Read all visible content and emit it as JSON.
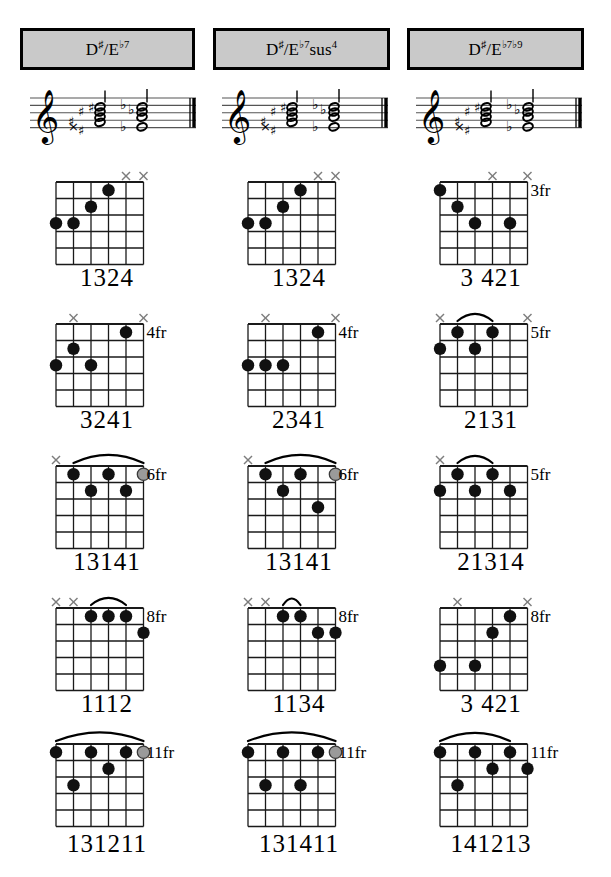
{
  "page": {
    "chord_family": "D#/Eb dominant 7 chords",
    "grid": {
      "columns": 3,
      "rows": 5
    }
  },
  "headers": [
    {
      "id": "header-eb7",
      "root": "D♯/E",
      "quality": "♭7",
      "display": "D♯/E♭7"
    },
    {
      "id": "header-eb7sus4",
      "root": "D♯/E",
      "quality": "♭7sus4",
      "display": "D♯/E♭7sus4"
    },
    {
      "id": "header-eb7b9",
      "root": "D♯/E",
      "quality": "♭7♭9",
      "display": "D♯/E♭7♭9"
    }
  ],
  "notation": [
    {
      "id": "staff-eb7",
      "clef": "treble",
      "accidentals": "sharps-and-flats",
      "barline": "final"
    },
    {
      "id": "staff-eb7sus4",
      "clef": "treble",
      "accidentals": "sharps-and-flats",
      "barline": "final"
    },
    {
      "id": "staff-eb7b9",
      "clef": "treble",
      "accidentals": "sharps-and-flats",
      "barline": "final"
    }
  ],
  "colors": {
    "grid_line": "#1a1a1a",
    "dot_filled": "#111111",
    "dot_optional": "#9a9a9a",
    "mute_mark": "#7d7d7d",
    "header_fill": "#c9c9c9",
    "header_border": "#000000"
  },
  "legend": {
    "filled_dot": "fretted note",
    "gray_dot": "optional note",
    "x_mark": "string not played",
    "arc": "barre"
  },
  "chords": [
    {
      "id": "eb7-pos1",
      "row": 1,
      "col": 1,
      "name": "D♯/E♭7",
      "fingering": "1324",
      "fret_label": "",
      "muted": [
        1,
        2
      ],
      "barre": null,
      "dots": [
        {
          "string": 3,
          "fret": 1,
          "type": "filled"
        },
        {
          "string": 4,
          "fret": 2,
          "type": "filled"
        },
        {
          "string": 5,
          "fret": 3,
          "type": "filled"
        },
        {
          "string": 6,
          "fret": 3,
          "type": "filled"
        }
      ]
    },
    {
      "id": "eb7sus4-pos1",
      "row": 1,
      "col": 2,
      "name": "D♯/E♭7sus4",
      "fingering": "1324",
      "fret_label": "",
      "muted": [
        1,
        2
      ],
      "barre": null,
      "dots": [
        {
          "string": 3,
          "fret": 1,
          "type": "filled"
        },
        {
          "string": 4,
          "fret": 2,
          "type": "filled"
        },
        {
          "string": 5,
          "fret": 3,
          "type": "filled"
        },
        {
          "string": 6,
          "fret": 3,
          "type": "filled"
        }
      ]
    },
    {
      "id": "eb7b9-pos1",
      "row": 1,
      "col": 3,
      "name": "D♯/E♭7♭9",
      "fingering": "3 421",
      "fret_label": "3fr",
      "muted": [
        1,
        3
      ],
      "barre": null,
      "dots": [
        {
          "string": 6,
          "fret": 1,
          "type": "filled"
        },
        {
          "string": 5,
          "fret": 2,
          "type": "filled"
        },
        {
          "string": 2,
          "fret": 3,
          "type": "filled"
        },
        {
          "string": 4,
          "fret": 3,
          "type": "filled"
        }
      ]
    },
    {
      "id": "eb7-pos2",
      "row": 2,
      "col": 1,
      "name": "D♯/E♭7",
      "fingering": "3241",
      "fret_label": "4fr",
      "muted": [
        1,
        5
      ],
      "barre": null,
      "dots": [
        {
          "string": 2,
          "fret": 1,
          "type": "filled"
        },
        {
          "string": 5,
          "fret": 2,
          "type": "filled"
        },
        {
          "string": 6,
          "fret": 3,
          "type": "filled"
        },
        {
          "string": 4,
          "fret": 3,
          "type": "filled"
        }
      ]
    },
    {
      "id": "eb7sus4-pos2",
      "row": 2,
      "col": 2,
      "name": "D♯/E♭7sus4",
      "fingering": "2341",
      "fret_label": "4fr",
      "muted": [
        1,
        5
      ],
      "barre": null,
      "dots": [
        {
          "string": 2,
          "fret": 1,
          "type": "filled"
        },
        {
          "string": 6,
          "fret": 3,
          "type": "filled"
        },
        {
          "string": 5,
          "fret": 3,
          "type": "filled"
        },
        {
          "string": 4,
          "fret": 3,
          "type": "filled"
        }
      ]
    },
    {
      "id": "eb7b9-pos2",
      "row": 2,
      "col": 3,
      "name": "D♯/E♭7♭9",
      "fingering": "2131",
      "fret_label": "5fr",
      "muted": [
        1,
        6
      ],
      "barre": {
        "from_string": 5,
        "to_string": 3,
        "fret": 1
      },
      "dots": [
        {
          "string": 5,
          "fret": 1,
          "type": "filled"
        },
        {
          "string": 3,
          "fret": 1,
          "type": "filled"
        },
        {
          "string": 6,
          "fret": 2,
          "type": "filled"
        },
        {
          "string": 4,
          "fret": 2,
          "type": "filled"
        }
      ]
    },
    {
      "id": "eb7-pos3",
      "row": 3,
      "col": 1,
      "name": "D♯/E♭7",
      "fingering": "13141",
      "fret_label": "6fr",
      "muted": [
        6
      ],
      "barre": {
        "from_string": 5,
        "to_string": 1,
        "fret": 1
      },
      "dots": [
        {
          "string": 5,
          "fret": 1,
          "type": "filled"
        },
        {
          "string": 3,
          "fret": 1,
          "type": "filled"
        },
        {
          "string": 1,
          "fret": 1,
          "type": "optional"
        },
        {
          "string": 4,
          "fret": 2,
          "type": "filled"
        },
        {
          "string": 2,
          "fret": 2,
          "type": "filled"
        }
      ]
    },
    {
      "id": "eb7sus4-pos3",
      "row": 3,
      "col": 2,
      "name": "D♯/E♭7sus4",
      "fingering": "13141",
      "fret_label": "6fr",
      "muted": [
        6
      ],
      "barre": {
        "from_string": 5,
        "to_string": 1,
        "fret": 1
      },
      "dots": [
        {
          "string": 5,
          "fret": 1,
          "type": "filled"
        },
        {
          "string": 3,
          "fret": 1,
          "type": "filled"
        },
        {
          "string": 1,
          "fret": 1,
          "type": "optional"
        },
        {
          "string": 4,
          "fret": 2,
          "type": "filled"
        },
        {
          "string": 2,
          "fret": 3,
          "type": "filled"
        }
      ]
    },
    {
      "id": "eb7b9-pos3",
      "row": 3,
      "col": 3,
      "name": "D♯/E♭7♭9",
      "fingering": "21314",
      "fret_label": "5fr",
      "muted": [
        6
      ],
      "barre": {
        "from_string": 5,
        "to_string": 3,
        "fret": 1
      },
      "dots": [
        {
          "string": 5,
          "fret": 1,
          "type": "filled"
        },
        {
          "string": 3,
          "fret": 1,
          "type": "filled"
        },
        {
          "string": 6,
          "fret": 2,
          "type": "filled"
        },
        {
          "string": 4,
          "fret": 2,
          "type": "filled"
        },
        {
          "string": 2,
          "fret": 2,
          "type": "filled"
        }
      ]
    },
    {
      "id": "eb7-pos4",
      "row": 4,
      "col": 1,
      "name": "D♯/E♭7",
      "fingering": "1112",
      "fret_label": "8fr",
      "muted": [
        6,
        5
      ],
      "barre": {
        "from_string": 4,
        "to_string": 2,
        "fret": 1
      },
      "dots": [
        {
          "string": 4,
          "fret": 1,
          "type": "filled"
        },
        {
          "string": 3,
          "fret": 1,
          "type": "filled"
        },
        {
          "string": 2,
          "fret": 1,
          "type": "filled"
        },
        {
          "string": 1,
          "fret": 2,
          "type": "filled"
        }
      ]
    },
    {
      "id": "eb7sus4-pos4",
      "row": 4,
      "col": 2,
      "name": "D♯/E♭7sus4",
      "fingering": "1134",
      "fret_label": "8fr",
      "muted": [
        6,
        5
      ],
      "barre": {
        "from_string": 4,
        "to_string": 3,
        "fret": 1
      },
      "dots": [
        {
          "string": 4,
          "fret": 1,
          "type": "filled"
        },
        {
          "string": 3,
          "fret": 1,
          "type": "filled"
        },
        {
          "string": 2,
          "fret": 2,
          "type": "filled"
        },
        {
          "string": 1,
          "fret": 2,
          "type": "filled"
        }
      ]
    },
    {
      "id": "eb7b9-pos4",
      "row": 4,
      "col": 3,
      "name": "D♯/E♭7♭9",
      "fingering": "3 421",
      "fret_label": "8fr",
      "muted": [
        5,
        1
      ],
      "barre": null,
      "dots": [
        {
          "string": 2,
          "fret": 1,
          "type": "filled"
        },
        {
          "string": 3,
          "fret": 2,
          "type": "filled"
        },
        {
          "string": 6,
          "fret": 4,
          "type": "filled"
        },
        {
          "string": 4,
          "fret": 4,
          "type": "filled"
        }
      ]
    },
    {
      "id": "eb7-pos5",
      "row": 5,
      "col": 1,
      "name": "D♯/E♭7",
      "fingering": "131211",
      "fret_label": "11fr",
      "muted": [],
      "barre": {
        "from_string": 6,
        "to_string": 1,
        "fret": 1
      },
      "dots": [
        {
          "string": 6,
          "fret": 1,
          "type": "filled"
        },
        {
          "string": 4,
          "fret": 1,
          "type": "filled"
        },
        {
          "string": 2,
          "fret": 1,
          "type": "filled"
        },
        {
          "string": 1,
          "fret": 1,
          "type": "optional"
        },
        {
          "string": 3,
          "fret": 2,
          "type": "filled"
        },
        {
          "string": 5,
          "fret": 3,
          "type": "filled"
        }
      ]
    },
    {
      "id": "eb7sus4-pos5",
      "row": 5,
      "col": 2,
      "name": "D♯/E♭7sus4",
      "fingering": "131411",
      "fret_label": "11fr",
      "muted": [],
      "barre": {
        "from_string": 6,
        "to_string": 1,
        "fret": 1
      },
      "dots": [
        {
          "string": 6,
          "fret": 1,
          "type": "filled"
        },
        {
          "string": 4,
          "fret": 1,
          "type": "filled"
        },
        {
          "string": 2,
          "fret": 1,
          "type": "filled"
        },
        {
          "string": 1,
          "fret": 1,
          "type": "optional"
        },
        {
          "string": 5,
          "fret": 3,
          "type": "filled"
        },
        {
          "string": 3,
          "fret": 3,
          "type": "filled"
        }
      ]
    },
    {
      "id": "eb7b9-pos5",
      "row": 5,
      "col": 3,
      "name": "D♯/E♭7♭9",
      "fingering": "141213",
      "fret_label": "11fr",
      "muted": [],
      "barre": {
        "from_string": 6,
        "to_string": 2,
        "fret": 1
      },
      "dots": [
        {
          "string": 6,
          "fret": 1,
          "type": "filled"
        },
        {
          "string": 4,
          "fret": 1,
          "type": "filled"
        },
        {
          "string": 2,
          "fret": 1,
          "type": "filled"
        },
        {
          "string": 3,
          "fret": 2,
          "type": "filled"
        },
        {
          "string": 1,
          "fret": 2,
          "type": "filled"
        },
        {
          "string": 5,
          "fret": 3,
          "type": "filled"
        }
      ]
    }
  ]
}
